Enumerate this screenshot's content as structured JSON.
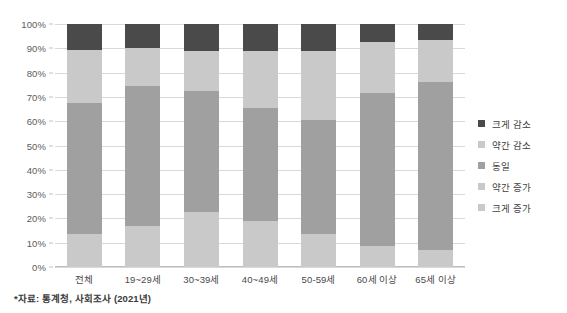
{
  "chart_data": {
    "type": "bar",
    "stacked": true,
    "stack_mode": "percent",
    "title": "",
    "subtitle": "",
    "xlabel": "",
    "ylabel": "",
    "ylim": [
      0,
      100
    ],
    "y_ticks": [
      "0%",
      "10%",
      "20%",
      "30%",
      "40%",
      "50%",
      "60%",
      "70%",
      "80%",
      "90%",
      "100%"
    ],
    "y_tick_values": [
      0,
      10,
      20,
      30,
      40,
      50,
      60,
      70,
      80,
      90,
      100
    ],
    "grid": true,
    "legend_position": "right",
    "categories": [
      "전체",
      "19~29세",
      "30~39세",
      "40~49세",
      "50-59세",
      "60세 이상",
      "65세 이상"
    ],
    "series": [
      {
        "name": "크게 증가",
        "color": "#c9c9c9",
        "values": [
          1.5,
          2.0,
          1.5,
          1.5,
          1.5,
          2.5,
          2.5
        ]
      },
      {
        "name": "약간 증가",
        "color": "#c9c9c9",
        "values": [
          12.0,
          15.0,
          21.0,
          17.5,
          12.0,
          6.0,
          4.5
        ]
      },
      {
        "name": "동일",
        "color": "#a0a0a0",
        "values": [
          54.0,
          57.5,
          50.0,
          46.5,
          47.0,
          63.0,
          69.0
        ]
      },
      {
        "name": "약간 감소",
        "color": "#c9c9c9",
        "values": [
          22.0,
          15.5,
          16.5,
          23.5,
          28.5,
          21.0,
          17.5
        ]
      },
      {
        "name": "크게 감소",
        "color": "#4a4a4a",
        "values": [
          10.5,
          10.0,
          11.0,
          11.0,
          11.0,
          7.5,
          6.5
        ]
      }
    ],
    "series_order_bottom_to_top": [
      "크게 증가",
      "약간 증가",
      "동일",
      "약간 감소",
      "크게 감소"
    ],
    "bar_tops_cumulative": {
      "전체": [
        1.5,
        13.5,
        67.5,
        89.5,
        100
      ],
      "19~29세": [
        2.0,
        17.0,
        74.5,
        90.0,
        100
      ],
      "30~39세": [
        1.5,
        22.5,
        72.5,
        89.0,
        100
      ],
      "40~49세": [
        1.5,
        19.0,
        65.5,
        89.0,
        100
      ],
      "50-59세": [
        1.5,
        13.5,
        60.5,
        89.0,
        100
      ],
      "60세 이상": [
        2.5,
        8.5,
        71.5,
        92.5,
        100
      ],
      "65세 이상": [
        2.5,
        7.0,
        76.0,
        93.5,
        100
      ]
    },
    "annotations": [
      "*자료: 통계청, 사회조사 (2021년)"
    ]
  },
  "legend": {
    "items": [
      {
        "label": "크게 감소",
        "color": "#4a4a4a"
      },
      {
        "label": "약간 감소",
        "color": "#c9c9c9"
      },
      {
        "label": "동일",
        "color": "#a0a0a0"
      },
      {
        "label": "약간 증가",
        "color": "#c9c9c9"
      },
      {
        "label": "크게 증가",
        "color": "#c9c9c9"
      }
    ]
  },
  "footnote": {
    "text": "*자료: 통계청, 사회조사 (2021년)"
  },
  "colors": {
    "dark": "#4a4a4a",
    "medium": "#a0a0a0",
    "light": "#c9c9c9",
    "grid": "#d9d9d9",
    "axis": "#bdbdbd",
    "background": "#ffffff"
  }
}
